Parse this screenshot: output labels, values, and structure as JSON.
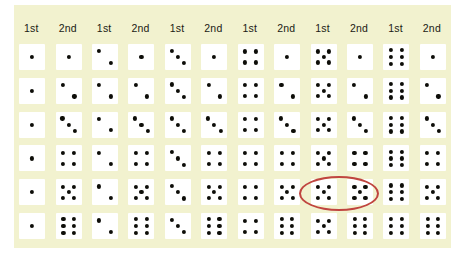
{
  "figure": {
    "board_color": "#f2f2cf",
    "die_face_color": "#ffffff",
    "pip_color": "#0d0d08",
    "highlight_color": "#c0453f"
  },
  "header": {
    "pairs": [
      {
        "first_label": "1st",
        "second_label": "2nd"
      },
      {
        "first_label": "1st",
        "second_label": "2nd"
      },
      {
        "first_label": "1st",
        "second_label": "2nd"
      },
      {
        "first_label": "1st",
        "second_label": "2nd"
      },
      {
        "first_label": "1st",
        "second_label": "2nd"
      },
      {
        "first_label": "1st",
        "second_label": "2nd"
      }
    ]
  },
  "chart_data": {
    "type": "table",
    "xlabel": "1st die",
    "ylabel": "2nd die",
    "categories": [
      "1",
      "2",
      "3",
      "4",
      "5",
      "6"
    ],
    "first_die_values": [
      1,
      2,
      3,
      4,
      5,
      6
    ],
    "second_die_values": [
      1,
      2,
      3,
      4,
      5,
      6
    ],
    "total_outcomes": 36,
    "highlighted_outcome": {
      "first": 5,
      "second": 5,
      "row": 5,
      "column": 5
    },
    "rows": [
      {
        "second": 1,
        "cells": [
          [
            1,
            1
          ],
          [
            2,
            1
          ],
          [
            3,
            1
          ],
          [
            4,
            1
          ],
          [
            5,
            1
          ],
          [
            6,
            1
          ]
        ]
      },
      {
        "second": 2,
        "cells": [
          [
            1,
            2
          ],
          [
            2,
            2
          ],
          [
            3,
            2
          ],
          [
            4,
            2
          ],
          [
            5,
            2
          ],
          [
            6,
            2
          ]
        ]
      },
      {
        "second": 3,
        "cells": [
          [
            1,
            3
          ],
          [
            2,
            3
          ],
          [
            3,
            3
          ],
          [
            4,
            3
          ],
          [
            5,
            3
          ],
          [
            6,
            3
          ]
        ]
      },
      {
        "second": 4,
        "cells": [
          [
            1,
            4
          ],
          [
            2,
            4
          ],
          [
            3,
            4
          ],
          [
            4,
            4
          ],
          [
            5,
            4
          ],
          [
            6,
            4
          ]
        ]
      },
      {
        "second": 5,
        "cells": [
          [
            1,
            5
          ],
          [
            2,
            5
          ],
          [
            3,
            5
          ],
          [
            4,
            5
          ],
          [
            5,
            5
          ],
          [
            6,
            5
          ]
        ]
      },
      {
        "second": 6,
        "cells": [
          [
            1,
            6
          ],
          [
            2,
            6
          ],
          [
            3,
            6
          ],
          [
            4,
            6
          ],
          [
            5,
            6
          ],
          [
            6,
            6
          ]
        ]
      }
    ]
  },
  "pip_layouts": {
    "1": [
      [
        50,
        50
      ]
    ],
    "2": [
      [
        28,
        28
      ],
      [
        72,
        72
      ]
    ],
    "3": [
      [
        26,
        26
      ],
      [
        50,
        50
      ],
      [
        74,
        74
      ]
    ],
    "4": [
      [
        29,
        29
      ],
      [
        71,
        29
      ],
      [
        29,
        71
      ],
      [
        71,
        71
      ]
    ],
    "5": [
      [
        29,
        29
      ],
      [
        71,
        29
      ],
      [
        50,
        50
      ],
      [
        29,
        71
      ],
      [
        71,
        71
      ]
    ],
    "6": [
      [
        30,
        24
      ],
      [
        70,
        24
      ],
      [
        30,
        50
      ],
      [
        70,
        50
      ],
      [
        30,
        76
      ],
      [
        70,
        76
      ]
    ]
  }
}
